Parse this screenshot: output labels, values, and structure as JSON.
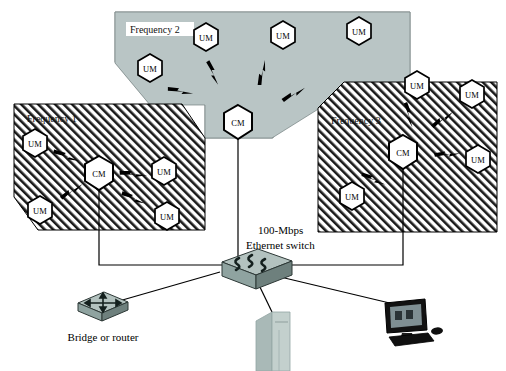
{
  "diagram": {
    "colors": {
      "zone_gray_fill": "#b9c5c5",
      "zone_hatch_line": "#1a1a1a",
      "outline": "#000000",
      "node_fill": "#ffffff",
      "device_body": "#8fa3a0",
      "device_top": "#b3c2bf",
      "device_side": "#6e807d",
      "pc_body": "#b7c6c4",
      "monitor_bezel": "#111111",
      "monitor_screen": "#7f8f93",
      "link_line": "#000000"
    },
    "zones": [
      {
        "id": "frequency-1",
        "label": "Frequency 1",
        "fill_style": "hatched",
        "label_background": "none",
        "nodes": [
          {
            "id": "f1-cm",
            "label": "CM",
            "role": "cable-modem",
            "x": 99,
            "y": 173
          },
          {
            "id": "f1-um1",
            "label": "UM",
            "role": "user-modem",
            "x": 35,
            "y": 142
          },
          {
            "id": "f1-um2",
            "label": "UM",
            "role": "user-modem",
            "x": 40,
            "y": 209
          },
          {
            "id": "f1-um3",
            "label": "UM",
            "role": "user-modem",
            "x": 164,
            "y": 170
          },
          {
            "id": "f1-um4",
            "label": "UM",
            "role": "user-modem",
            "x": 167,
            "y": 215
          }
        ],
        "wireless_links": 4
      },
      {
        "id": "frequency-2",
        "label": "Frequency 2",
        "fill_style": "solid-gray",
        "label_background": "white",
        "nodes": [
          {
            "id": "f2-cm",
            "label": "CM",
            "role": "cable-modem",
            "x": 238,
            "y": 122
          },
          {
            "id": "f2-um1",
            "label": "UM",
            "role": "user-modem",
            "x": 150,
            "y": 67
          },
          {
            "id": "f2-um2",
            "label": "UM",
            "role": "user-modem",
            "x": 206,
            "y": 36
          },
          {
            "id": "f2-um3",
            "label": "UM",
            "role": "user-modem",
            "x": 283,
            "y": 34
          },
          {
            "id": "f2-um4",
            "label": "UM",
            "role": "user-modem",
            "x": 359,
            "y": 30
          }
        ],
        "wireless_links": 4
      },
      {
        "id": "frequency-3",
        "label": "Frequency 3",
        "fill_style": "hatched",
        "label_background": "none",
        "nodes": [
          {
            "id": "f3-cm",
            "label": "CM",
            "role": "cable-modem",
            "x": 403,
            "y": 152
          },
          {
            "id": "f3-um1",
            "label": "UM",
            "role": "user-modem",
            "x": 417,
            "y": 84
          },
          {
            "id": "f3-um2",
            "label": "UM",
            "role": "user-modem",
            "x": 472,
            "y": 93
          },
          {
            "id": "f3-um3",
            "label": "UM",
            "role": "user-modem",
            "x": 478,
            "y": 158
          },
          {
            "id": "f3-um4",
            "label": "UM",
            "role": "user-modem",
            "x": 352,
            "y": 195
          }
        ],
        "wireless_links": 4
      }
    ],
    "devices": [
      {
        "id": "ethernet-switch",
        "caption_line_1": "100-Mbps",
        "caption_line_2": "Ethernet switch",
        "type": "switch",
        "x": 243,
        "y": 272
      },
      {
        "id": "bridge-router",
        "caption_line_1": "Bridge or router",
        "caption_line_2": "",
        "type": "router",
        "x": 102,
        "y": 307
      },
      {
        "id": "desktop-pc",
        "caption_line_1": "",
        "caption_line_2": "",
        "type": "tower-pc",
        "x": 272,
        "y": 335
      },
      {
        "id": "workstation-monitor",
        "caption_line_1": "",
        "caption_line_2": "",
        "type": "monitor",
        "x": 406,
        "y": 325
      }
    ],
    "wired_links": [
      {
        "from": "frequency-1-cm",
        "to": "ethernet-switch"
      },
      {
        "from": "frequency-2-cm",
        "to": "ethernet-switch"
      },
      {
        "from": "frequency-3-cm",
        "to": "ethernet-switch"
      },
      {
        "from": "ethernet-switch",
        "to": "bridge-router"
      },
      {
        "from": "ethernet-switch",
        "to": "desktop-pc"
      },
      {
        "from": "ethernet-switch",
        "to": "workstation-monitor"
      }
    ]
  }
}
